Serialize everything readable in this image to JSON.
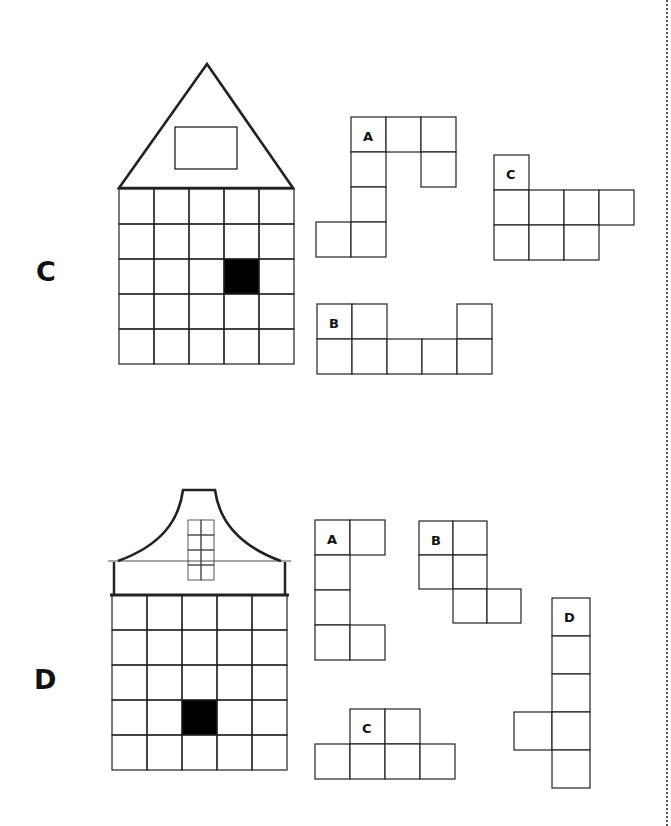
{
  "puzzles": [
    {
      "label": "C",
      "label_pos": [
        36,
        258
      ],
      "house": {
        "roof": "triangle",
        "roof_points": [
          [
            119,
            188
          ],
          [
            207,
            64
          ],
          [
            293,
            188
          ]
        ],
        "roof_window": [
          175,
          127,
          62,
          42
        ],
        "grid": {
          "x": 119,
          "y": 189,
          "cols": 5,
          "rows": 5,
          "cell": 35
        },
        "filled_cell": [
          3,
          2
        ]
      },
      "pieces": [
        {
          "label": "A",
          "cell": 35,
          "origin": [
            316,
            117
          ],
          "cells": [
            [
              1,
              0
            ],
            [
              2,
              0
            ],
            [
              3,
              0
            ],
            [
              1,
              1
            ],
            [
              3,
              1
            ],
            [
              1,
              2
            ],
            [
              0,
              3
            ],
            [
              1,
              3
            ]
          ],
          "label_cell": [
            1,
            0
          ]
        },
        {
          "label": "C",
          "cell": 35,
          "origin": [
            494,
            155
          ],
          "cells": [
            [
              0,
              0
            ],
            [
              0,
              1
            ],
            [
              1,
              1
            ],
            [
              2,
              1
            ],
            [
              3,
              1
            ],
            [
              0,
              2
            ],
            [
              1,
              2
            ],
            [
              2,
              2
            ]
          ],
          "label_cell": [
            0,
            0
          ]
        },
        {
          "label": "B",
          "cell": 35,
          "origin": [
            317,
            304
          ],
          "cells": [
            [
              0,
              0
            ],
            [
              1,
              0
            ],
            [
              4,
              0
            ],
            [
              0,
              1
            ],
            [
              1,
              1
            ],
            [
              2,
              1
            ],
            [
              3,
              1
            ],
            [
              4,
              1
            ]
          ],
          "label_cell": [
            0,
            0
          ]
        }
      ]
    },
    {
      "label": "D",
      "label_pos": [
        34,
        666
      ],
      "house": {
        "roof": "bell",
        "grid": {
          "x": 112,
          "y": 595,
          "cols": 5,
          "rows": 5,
          "cell": 35
        },
        "filled_cell": [
          2,
          3
        ]
      },
      "pieces": [
        {
          "label": "A",
          "cell": 35,
          "origin": [
            315,
            520
          ],
          "cells": [
            [
              0,
              0
            ],
            [
              1,
              0
            ],
            [
              0,
              1
            ],
            [
              0,
              2
            ],
            [
              0,
              3
            ],
            [
              1,
              3
            ]
          ],
          "label_cell": [
            0,
            0
          ]
        },
        {
          "label": "B",
          "cell": 34,
          "origin": [
            419,
            521
          ],
          "cells": [
            [
              0,
              0
            ],
            [
              1,
              0
            ],
            [
              0,
              1
            ],
            [
              1,
              1
            ],
            [
              1,
              2
            ],
            [
              2,
              2
            ]
          ],
          "label_cell": [
            0,
            0
          ]
        },
        {
          "label": "D",
          "cell": 38,
          "origin": [
            514,
            598
          ],
          "cells": [
            [
              1,
              0
            ],
            [
              1,
              1
            ],
            [
              1,
              2
            ],
            [
              0,
              3
            ],
            [
              1,
              3
            ],
            [
              1,
              4
            ]
          ],
          "label_cell": [
            1,
            0
          ]
        },
        {
          "label": "C",
          "cell": 35,
          "origin": [
            315,
            709
          ],
          "cells": [
            [
              1,
              0
            ],
            [
              2,
              0
            ],
            [
              0,
              1
            ],
            [
              1,
              1
            ],
            [
              2,
              1
            ],
            [
              3,
              1
            ]
          ],
          "label_cell": [
            1,
            0
          ]
        }
      ]
    }
  ],
  "colors": {
    "line": "#222222",
    "fill": "#000000",
    "dots": "#555555"
  }
}
